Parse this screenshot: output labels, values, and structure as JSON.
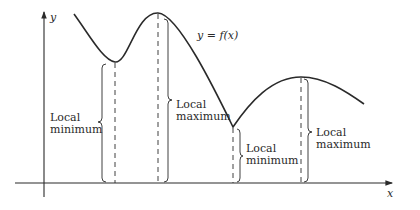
{
  "axes": {
    "x_label": "x",
    "y_label": "y"
  },
  "curve": {
    "label": "y = f(x)"
  },
  "annotations": [
    {
      "line1": "Local",
      "line2": "minimum"
    },
    {
      "line1": "Local",
      "line2": "maximum"
    },
    {
      "line1": "Local",
      "line2": "minimum"
    },
    {
      "line1": "Local",
      "line2": "maximum"
    }
  ],
  "colors": {
    "ink": "#2a2a2a",
    "background": "#ffffff"
  }
}
